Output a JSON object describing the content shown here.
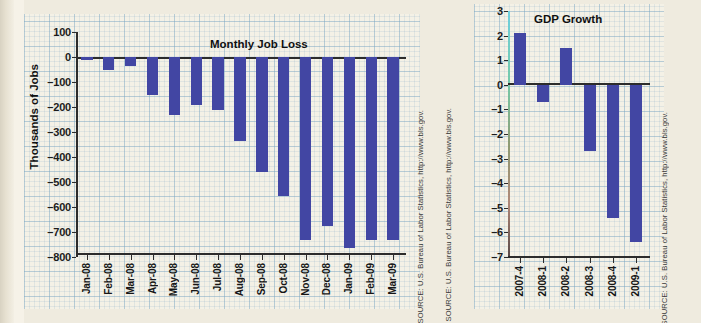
{
  "source_note": "SOURCE: U.S. Bureau of Labor Statistics, http://www.bls.gov.",
  "colors": {
    "bar": "#4246a3",
    "grid": "#78a5c3",
    "plot_bg": "#f4f1e6",
    "page_bg": "#efebdf",
    "axis": "#2c2c2c"
  },
  "chart_data": [
    {
      "id": "monthly-job-loss",
      "type": "bar",
      "title": "Monthly Job Loss",
      "xlabel": "",
      "ylabel": "Thousands of Jobs",
      "ylim": [
        -800,
        100
      ],
      "yticks": [
        100,
        0,
        -100,
        -200,
        -300,
        -400,
        -500,
        -600,
        -700,
        -800
      ],
      "ytick_labels": [
        "100",
        "0",
        "–100",
        "–200",
        "–300",
        "–400",
        "–500",
        "–600",
        "–700",
        "–800"
      ],
      "grid": true,
      "legend": "none",
      "categories": [
        "Jan-08",
        "Feb-08",
        "Mar-08",
        "Apr-08",
        "May-08",
        "Jun-08",
        "Jul-08",
        "Aug-08",
        "Sep-08",
        "Oct-08",
        "Nov-08",
        "Dec-08",
        "Jan-09",
        "Feb-09",
        "Mar-09"
      ],
      "values": [
        -10,
        -50,
        -35,
        -150,
        -230,
        -190,
        -210,
        -335,
        -460,
        -555,
        -730,
        -675,
        -765,
        -730,
        -730
      ],
      "source": "SOURCE: U.S. Bureau of Labor Statistics, http://www.bls.gov."
    },
    {
      "id": "gdp-growth",
      "type": "bar",
      "title": "GDP Growth",
      "xlabel": "",
      "ylabel": "",
      "ylim": [
        -7,
        3
      ],
      "yticks": [
        3,
        2,
        1,
        0,
        -1,
        -2,
        -3,
        -4,
        -5,
        -6,
        -7
      ],
      "ytick_labels": [
        "3",
        "2",
        "1",
        "0",
        "–1",
        "–2",
        "–3",
        "–4",
        "–5",
        "–6",
        "–7"
      ],
      "grid": true,
      "legend": "none",
      "categories": [
        "2007-4",
        "2008-1",
        "2008-2",
        "2008-3",
        "2008-4",
        "2009-1"
      ],
      "values": [
        2.1,
        -0.7,
        1.5,
        -2.7,
        -5.4,
        -6.4
      ],
      "source": "SOURCE: U.S. Bureau of Labor Statistics, http://www.bls.gov."
    }
  ]
}
